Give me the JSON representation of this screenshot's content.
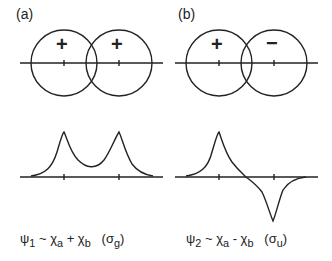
{
  "panels": [
    {
      "label": "(a)",
      "signs": [
        "+",
        "+"
      ],
      "caption": {
        "psi": "ψ",
        "psi_sub": "1",
        "rel": "~",
        "chi1": "χ",
        "sub1": "a",
        "op": "+",
        "chi2": "χ",
        "sub2": "b",
        "sym": "(σ",
        "sym_sub": "g",
        "close": ")"
      }
    },
    {
      "label": "(b)",
      "signs": [
        "+",
        "−"
      ],
      "caption": {
        "psi": "ψ",
        "psi_sub": "2",
        "rel": "~",
        "chi1": "χ",
        "sub1": "a",
        "op": "-",
        "chi2": "χ",
        "sub2": "b",
        "sym": "(σ",
        "sym_sub": "u",
        "close": ")"
      }
    }
  ],
  "colors": {
    "stroke": "#222222",
    "background": "#ffffff"
  }
}
